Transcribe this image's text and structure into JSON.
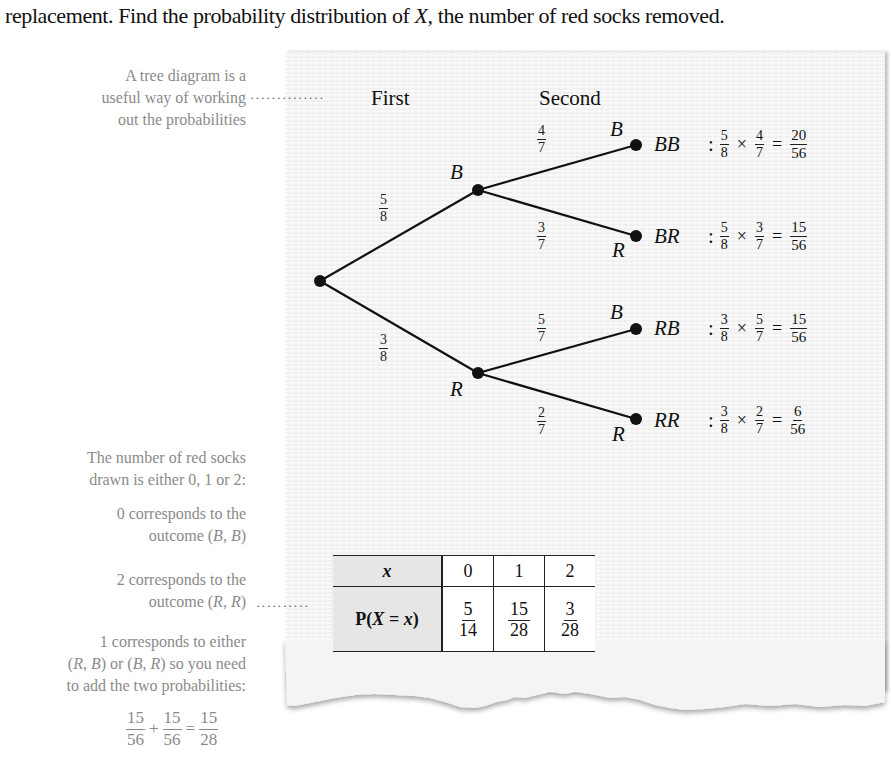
{
  "intro_text": "replacement. Find the probability distribution of X, the number of red socks removed.",
  "side_notes": {
    "tree_note": [
      "A tree diagram is a",
      "useful way of working",
      "out the probabilities"
    ],
    "red_count_note": [
      "The number of red socks",
      "drawn is either 0, 1 or 2:"
    ],
    "zero_note": [
      "0 corresponds to the",
      "outcome (B, B)"
    ],
    "two_note": [
      "2 corresponds to the",
      "outcome (R, R)"
    ],
    "one_note": [
      "1 corresponds to either",
      "(R, B) or (B, R) so you need",
      "to add the two probabilities:"
    ],
    "sum": {
      "terms": [
        {
          "num": "15",
          "den": "56"
        },
        {
          "num": "15",
          "den": "56"
        }
      ],
      "plus": "+",
      "equals": "=",
      "result": {
        "num": "15",
        "den": "28"
      }
    },
    "leader_dots": "··············",
    "leader_dots_short": "··········"
  },
  "tree": {
    "headers": {
      "first": "First",
      "second": "Second"
    },
    "first_branches": [
      {
        "label": "B",
        "prob": {
          "num": "5",
          "den": "8"
        }
      },
      {
        "label": "R",
        "prob": {
          "num": "3",
          "den": "8"
        }
      }
    ],
    "second_branches": [
      {
        "label": "B",
        "prob": {
          "num": "4",
          "den": "7"
        }
      },
      {
        "label": "R",
        "prob": {
          "num": "3",
          "den": "7"
        }
      },
      {
        "label": "B",
        "prob": {
          "num": "5",
          "den": "7"
        }
      },
      {
        "label": "R",
        "prob": {
          "num": "2",
          "den": "7"
        }
      }
    ],
    "outcomes": [
      {
        "name": "BB",
        "a": {
          "num": "5",
          "den": "8"
        },
        "b": {
          "num": "4",
          "den": "7"
        },
        "r": {
          "num": "20",
          "den": "56"
        }
      },
      {
        "name": "BR",
        "a": {
          "num": "5",
          "den": "8"
        },
        "b": {
          "num": "3",
          "den": "7"
        },
        "r": {
          "num": "15",
          "den": "56"
        }
      },
      {
        "name": "RB",
        "a": {
          "num": "3",
          "den": "8"
        },
        "b": {
          "num": "5",
          "den": "7"
        },
        "r": {
          "num": "15",
          "den": "56"
        }
      },
      {
        "name": "RR",
        "a": {
          "num": "3",
          "den": "8"
        },
        "b": {
          "num": "2",
          "den": "7"
        },
        "r": {
          "num": "6",
          "den": "56"
        }
      }
    ],
    "colon": ":",
    "times": "×",
    "equals": "="
  },
  "distribution_table": {
    "row1_header": "x",
    "row2_header": "P(X = x)",
    "x_values": [
      "0",
      "1",
      "2"
    ],
    "probabilities": [
      {
        "num": "5",
        "den": "14"
      },
      {
        "num": "15",
        "den": "28"
      },
      {
        "num": "3",
        "den": "28"
      }
    ]
  }
}
